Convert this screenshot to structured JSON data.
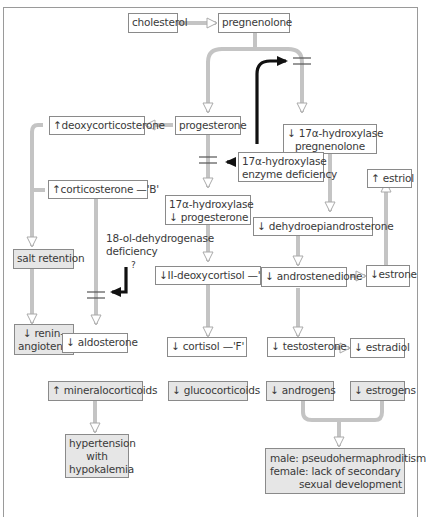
{
  "nodes": {
    "cholesterol": "cholesterol",
    "pregnenolone": "pregnenolone",
    "progesterone": "progesterone",
    "deoxycorticosterone": "↑deoxycorticosterone",
    "hydroxy_preg_1": "↓ 17α-hydroxylase",
    "hydroxy_preg_2": "pregnenolone",
    "corticosterone": "↑corticosterone —'B'",
    "enzyme_def_1": "17α-hydroxylase",
    "enzyme_def_2": "enzyme deficiency",
    "estriol": "↑ estriol",
    "hydroxy_prog_1": "17α-hydroxylase",
    "hydroxy_prog_2": "↓ progesterone",
    "dhea": "↓ dehydroepiandrosterone",
    "salt_retention": "salt retention",
    "dehydrogenase_def_1": "18-ol-dehydrogenase",
    "dehydrogenase_def_2": "deficiency",
    "question_mark": "?",
    "deoxycortisol": "↓II-deoxycortisol —'S'",
    "androstenedione": "↓ androstenedione",
    "estrone": "↓estrone",
    "renin_1": "↓ renin–",
    "renin_2": "angiotensin",
    "aldosterone": "↓ aldosterone",
    "cortisol": "↓ cortisol —'F'",
    "testosterone": "↓ testosterone",
    "estradiol": "↓ estradiol",
    "mineralocorticoids": "↑ mineralocorticoids",
    "glucocorticoids": "↓ glucocorticoids",
    "androgens": "↓ androgens",
    "estrogens": "↓ estrogens",
    "hypertension_1": "hypertension",
    "hypertension_2": "with",
    "hypertension_3": "hypokalemia",
    "outcome_male": "male: pseudohermaphroditism",
    "outcome_female_1": "female: lack of secondary",
    "outcome_female_2": "sexual development"
  },
  "colors": {
    "box_border": "#8a8a8a",
    "shaded_fill": "#e6e6e6",
    "pathway_arrow": "#b8b8b8",
    "deficiency_arrow": "#111111",
    "text": "#3a3a3a"
  }
}
